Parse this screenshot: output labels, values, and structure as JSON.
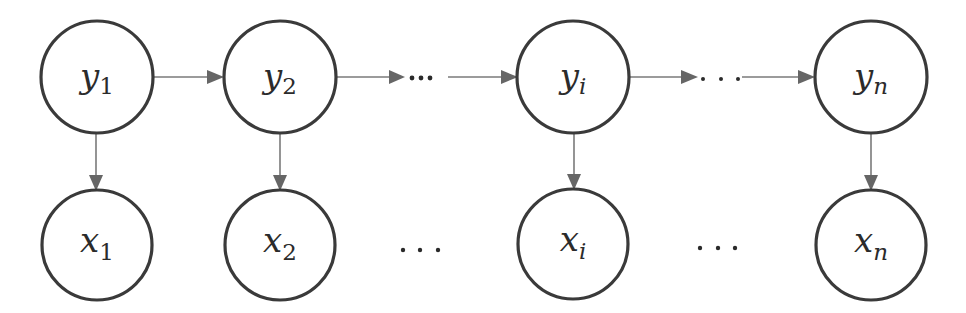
{
  "diagram": {
    "type": "hidden-markov-model",
    "colors": {
      "node_stroke": "#3a3a3a",
      "edge": "#7a7a7a",
      "arrow_head": "#666666",
      "text": "#2b2b2b",
      "background": "#ffffff"
    },
    "hidden_nodes": [
      {
        "id": "y1",
        "base": "y",
        "sub": "1",
        "sub_italic": false,
        "cx": 97,
        "cy": 77
      },
      {
        "id": "y2",
        "base": "y",
        "sub": "2",
        "sub_italic": false,
        "cx": 280,
        "cy": 77
      },
      {
        "id": "yi",
        "base": "y",
        "sub": "i",
        "sub_italic": true,
        "cx": 573,
        "cy": 77
      },
      {
        "id": "yn",
        "base": "y",
        "sub": "n",
        "sub_italic": true,
        "cx": 871,
        "cy": 77
      }
    ],
    "observed_nodes": [
      {
        "id": "x1",
        "base": "x",
        "sub": "1",
        "sub_italic": false,
        "cx": 97,
        "cy": 244
      },
      {
        "id": "x2",
        "base": "x",
        "sub": "2",
        "sub_italic": false,
        "cx": 280,
        "cy": 244
      },
      {
        "id": "xi",
        "base": "x",
        "sub": "i",
        "sub_italic": true,
        "cx": 573,
        "cy": 244
      },
      {
        "id": "xn",
        "base": "x",
        "sub": "n",
        "sub_italic": true,
        "cx": 871,
        "cy": 244
      }
    ],
    "node_radius": 56,
    "transitions": [
      {
        "from": "y1",
        "to": "y2"
      },
      {
        "from": "y2",
        "to": "…",
        "ellipsis": "···"
      },
      {
        "from": "…",
        "to": "yi"
      },
      {
        "from": "yi",
        "to": "…",
        "ellipsis": ". . ."
      },
      {
        "from": "…",
        "to": "yn"
      }
    ],
    "emissions": [
      {
        "from": "y1",
        "to": "x1"
      },
      {
        "from": "y2",
        "to": "x2"
      },
      {
        "from": "yi",
        "to": "xi"
      },
      {
        "from": "yn",
        "to": "xn"
      }
    ],
    "bottom_ellipses": [
      {
        "between": [
          "x2",
          "xi"
        ],
        "text": "· · ·"
      },
      {
        "between": [
          "xi",
          "xn"
        ],
        "text": "· · ·"
      }
    ]
  },
  "labels": {
    "y1": {
      "base": "y",
      "sub": "1"
    },
    "y2": {
      "base": "y",
      "sub": "2"
    },
    "yi": {
      "base": "y",
      "sub": "i"
    },
    "yn": {
      "base": "y",
      "sub": "n"
    },
    "x1": {
      "base": "x",
      "sub": "1"
    },
    "x2": {
      "base": "x",
      "sub": "2"
    },
    "xi": {
      "base": "x",
      "sub": "i"
    },
    "xn": {
      "base": "x",
      "sub": "n"
    }
  }
}
